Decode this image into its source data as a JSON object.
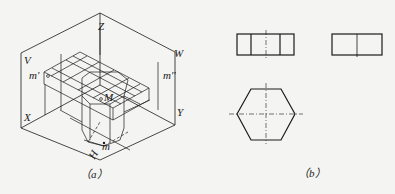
{
  "figure_a": {
    "caption": "（a）",
    "labels": {
      "z": "Z",
      "v": "V",
      "w": "W",
      "x": "X",
      "y": "Y",
      "h": "H",
      "m_prime": "m'",
      "m_double_prime": "m''",
      "M": "M",
      "m": "m"
    }
  },
  "figure_b": {
    "caption": "（b）",
    "views": [
      "front-view",
      "side-view",
      "top-view-hexagon"
    ]
  },
  "colors": {
    "line": "#1a1a1a",
    "background": "#f4f4f2"
  }
}
